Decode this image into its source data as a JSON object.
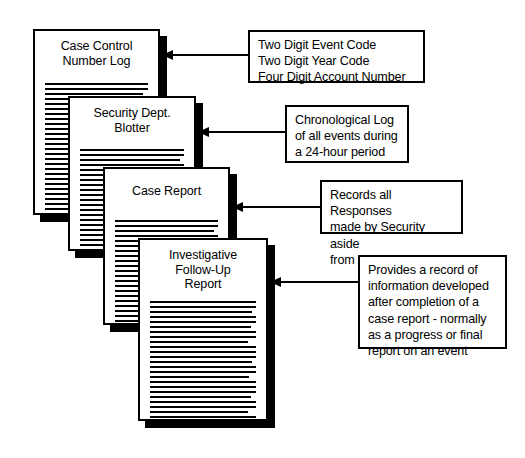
{
  "diagram": {
    "background_color": "#ffffff",
    "ink_color": "#000000"
  },
  "documents": [
    {
      "id": "case-control-number-log",
      "title": "Case Control\nNumber Log",
      "body_line_count": 26
    },
    {
      "id": "security-dept-blotter",
      "title": "Security Dept.\nBlotter",
      "body_line_count": 22
    },
    {
      "id": "case-report",
      "title": "Case Report",
      "body_line_count": 22
    },
    {
      "id": "investigative-follow-up-report",
      "title": "Investigative\nFollow-Up\nReport",
      "body_line_count": 26
    }
  ],
  "callouts": [
    {
      "id": "callout-case-control-number-log",
      "text": "Two Digit Event Code\nTwo Digit Year Code\nFour Digit Account Number"
    },
    {
      "id": "callout-security-dept-blotter",
      "text": "Chronological Log\nof all events during\na 24-hour period"
    },
    {
      "id": "callout-case-report",
      "text": "Records all Responses\nmade by Security aside\nfrom routine duties"
    },
    {
      "id": "callout-investigative-follow-up-report",
      "text": "Provides a record of\ninformation developed\nafter completion of a\ncase report - normally\nas a progress or final\nreport on an event"
    }
  ]
}
